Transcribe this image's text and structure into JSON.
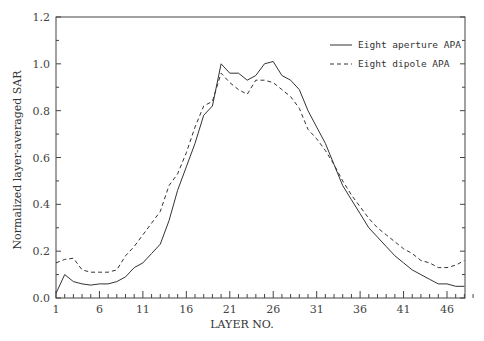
{
  "chart_data": {
    "type": "line",
    "title": "",
    "xlabel": "LAYER NO.",
    "ylabel": "Normalized  layer-averaged  SAR",
    "xlim": [
      1,
      49
    ],
    "ylim": [
      0.0,
      1.2
    ],
    "x_ticks": [
      "1",
      "6",
      "11",
      "16",
      "21",
      "26",
      "31",
      "36",
      "41",
      "46"
    ],
    "y_ticks": [
      "0.0",
      "0.2",
      "0.4",
      "0.6",
      "0.8",
      "1.0",
      "1.2"
    ],
    "grid": false,
    "legend_position": "upper right",
    "x": [
      1,
      2,
      3,
      4,
      5,
      6,
      7,
      8,
      9,
      10,
      11,
      12,
      13,
      14,
      15,
      16,
      17,
      18,
      19,
      20,
      21,
      22,
      23,
      24,
      25,
      26,
      27,
      28,
      29,
      30,
      31,
      32,
      33,
      34,
      35,
      36,
      37,
      38,
      39,
      40,
      41,
      42,
      43,
      44,
      45,
      46,
      47,
      48
    ],
    "series": [
      {
        "name": "Eight aperture APA",
        "style": "solid",
        "values": [
          0.02,
          0.1,
          0.07,
          0.06,
          0.055,
          0.06,
          0.06,
          0.07,
          0.09,
          0.13,
          0.15,
          0.19,
          0.23,
          0.33,
          0.46,
          0.56,
          0.66,
          0.78,
          0.82,
          1.0,
          0.96,
          0.96,
          0.93,
          0.95,
          1.0,
          1.01,
          0.95,
          0.93,
          0.89,
          0.8,
          0.73,
          0.66,
          0.57,
          0.48,
          0.42,
          0.36,
          0.3,
          0.26,
          0.22,
          0.18,
          0.15,
          0.12,
          0.1,
          0.08,
          0.06,
          0.06,
          0.05,
          0.05
        ]
      },
      {
        "name": "Eight dipole APA",
        "style": "dashed",
        "values": [
          0.15,
          0.165,
          0.17,
          0.12,
          0.11,
          0.11,
          0.11,
          0.12,
          0.18,
          0.22,
          0.27,
          0.32,
          0.37,
          0.48,
          0.53,
          0.62,
          0.73,
          0.82,
          0.84,
          0.96,
          0.92,
          0.89,
          0.87,
          0.93,
          0.93,
          0.92,
          0.89,
          0.86,
          0.81,
          0.72,
          0.68,
          0.63,
          0.57,
          0.5,
          0.44,
          0.39,
          0.34,
          0.3,
          0.27,
          0.24,
          0.21,
          0.19,
          0.16,
          0.15,
          0.13,
          0.13,
          0.14,
          0.16
        ]
      }
    ]
  }
}
